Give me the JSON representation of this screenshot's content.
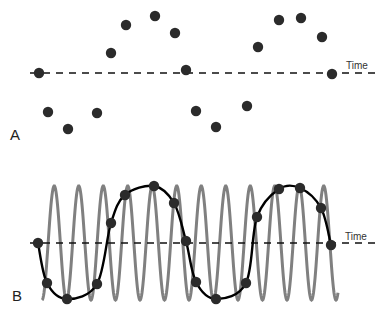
{
  "figure": {
    "panels": [
      {
        "id": "A",
        "label": "A",
        "axis_label": "Time",
        "baseline_y": 73,
        "baseline_x": [
          30,
          380
        ],
        "dot_color": "#2b2b2b",
        "dots": [
          [
            39,
            73
          ],
          [
            48,
            112
          ],
          [
            68,
            129
          ],
          [
            97,
            113
          ],
          [
            111,
            53
          ],
          [
            126,
            25
          ],
          [
            155,
            16
          ],
          [
            175,
            33
          ],
          [
            186,
            70
          ],
          [
            196,
            111
          ],
          [
            216,
            127
          ],
          [
            247,
            106
          ],
          [
            258,
            47
          ],
          [
            279,
            20
          ],
          [
            301,
            18
          ],
          [
            322,
            37
          ],
          [
            332,
            74
          ]
        ]
      },
      {
        "id": "B",
        "label": "B",
        "axis_label": "Time",
        "baseline_y": 243,
        "baseline_x": [
          30,
          380
        ],
        "dot_color": "#2b2b2b",
        "curve_color": "#000000",
        "coil_color": "#808080",
        "coil": {
          "x_start": 42,
          "x_end": 338,
          "period": 24.5,
          "top": 186,
          "bottom": 300
        },
        "dots": [
          [
            38,
            243
          ],
          [
            47,
            283
          ],
          [
            67,
            299
          ],
          [
            97,
            284
          ],
          [
            111,
            223
          ],
          [
            125,
            195
          ],
          [
            154,
            186
          ],
          [
            174,
            203
          ],
          [
            186,
            241
          ],
          [
            196,
            282
          ],
          [
            216,
            299
          ],
          [
            246,
            283
          ],
          [
            257,
            217
          ],
          [
            279,
            189
          ],
          [
            300,
            188
          ],
          [
            321,
            208
          ],
          [
            331,
            245
          ]
        ]
      }
    ]
  }
}
